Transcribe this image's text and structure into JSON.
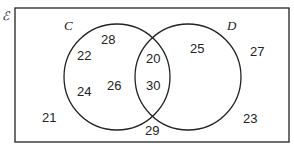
{
  "diagram": {
    "universal_symbol": "ℰ",
    "sets": [
      {
        "label": "C",
        "cx": 117,
        "cy": 77,
        "r": 53
      },
      {
        "label": "D",
        "cx": 188,
        "cy": 77,
        "r": 53
      }
    ],
    "regions": {
      "only_C": [
        "28",
        "22",
        "24",
        "26"
      ],
      "C_and_D": [
        "20",
        "30"
      ],
      "only_D": [
        "25"
      ],
      "neither": [
        "27",
        "21",
        "23"
      ],
      "boundary_bottom": "29"
    },
    "elements": [
      {
        "value": "28",
        "x": 101,
        "y": 44
      },
      {
        "value": "22",
        "x": 77,
        "y": 60
      },
      {
        "value": "24",
        "x": 77,
        "y": 96
      },
      {
        "value": "26",
        "x": 107,
        "y": 90
      },
      {
        "value": "20",
        "x": 146,
        "y": 63
      },
      {
        "value": "30",
        "x": 146,
        "y": 90
      },
      {
        "value": "25",
        "x": 190,
        "y": 53
      },
      {
        "value": "27",
        "x": 250,
        "y": 56
      },
      {
        "value": "21",
        "x": 42,
        "y": 122
      },
      {
        "value": "23",
        "x": 243,
        "y": 123
      },
      {
        "value": "29",
        "x": 145,
        "y": 135
      }
    ],
    "colors": {
      "stroke": "#222222",
      "background": "#ffffff"
    }
  }
}
